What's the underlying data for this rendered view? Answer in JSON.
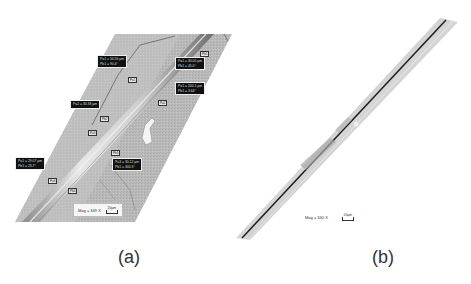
{
  "figure": {
    "panels": [
      {
        "id": "a",
        "caption": "(a)",
        "magnification": "Mag = 349 X",
        "scale_bar": "20µm",
        "measurements": [
          {
            "line1": "Pa1 = 50.56 µm",
            "line2": "Pb1 = 90.4°"
          },
          {
            "line1": "Pa1 = 30.00 µm",
            "line2": "Pb1 = 45.0°"
          },
          {
            "line1": "Pa1 = 200.1 µm",
            "line2": "Pb1 = 3.64°"
          },
          {
            "line1": "Pa2 = 30.38 µm",
            "line2": ""
          },
          {
            "line1": "Pa1 = 29.07 µm",
            "line2": "Pb1 = 23.7°"
          },
          {
            "line1": "Pa3 = 30.12 µm",
            "line2": "Pb1 = 300.3°"
          }
        ],
        "point_tags": [
          "Pa1",
          "Pb1",
          "Pa2",
          "Pb2",
          "Pa3",
          "Pb3",
          "Pa4",
          "Pb4"
        ]
      },
      {
        "id": "b",
        "caption": "(b)",
        "magnification": "Mag = 340 X",
        "scale_bar": "20µm"
      }
    ],
    "colors": {
      "background": "#ffffff",
      "substrate": "#b8b8b8",
      "fiber": "#d9d9d9",
      "label_bg": "#111111"
    }
  }
}
